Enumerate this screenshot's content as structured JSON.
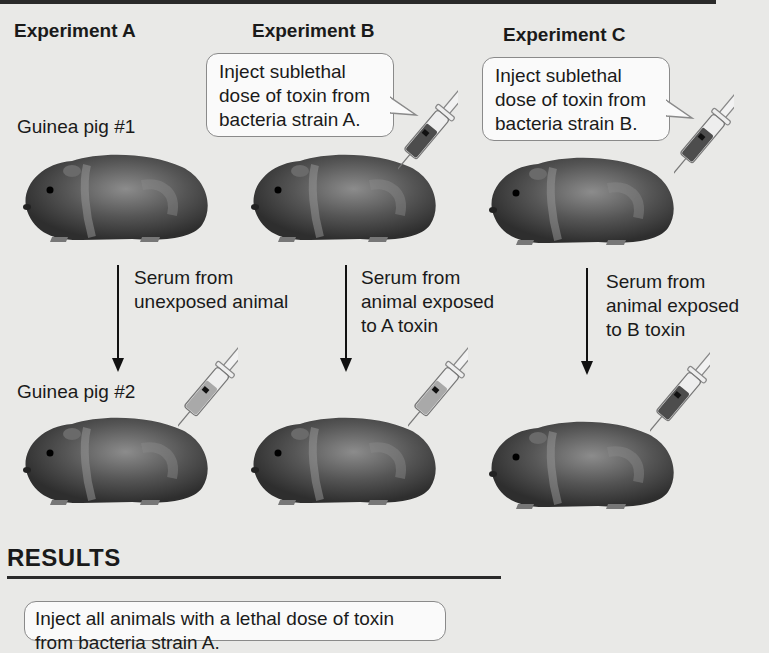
{
  "experiments": [
    {
      "title": "Experiment A",
      "pig1_label": "Guinea pig #1",
      "serum_label_line1": "Serum from",
      "serum_label_line2": "unexposed animal",
      "serum_label_line3": ""
    },
    {
      "title": "Experiment B",
      "callout_line1": "Inject sublethal",
      "callout_line2": "dose of toxin from",
      "callout_line3": "bacteria strain A.",
      "serum_label_line1": "Serum from",
      "serum_label_line2": "animal exposed",
      "serum_label_line3": "to A toxin"
    },
    {
      "title": "Experiment C",
      "callout_line1": "Inject sublethal",
      "callout_line2": "dose of toxin from",
      "callout_line3": "bacteria strain B.",
      "serum_label_line1": "Serum from",
      "serum_label_line2": "animal exposed",
      "serum_label_line3": "to B toxin"
    }
  ],
  "pig2_label": "Guinea pig #2",
  "results": {
    "title": "RESULTS",
    "instruction": "Inject all animals with a lethal dose of toxin from bacteria strain A."
  },
  "colors": {
    "background": "#e9e9e7",
    "pig_body": "#4a4a4a",
    "syringe_fluid_dark": "#4d4d4d",
    "syringe_fluid_light": "#a9a9a9"
  }
}
